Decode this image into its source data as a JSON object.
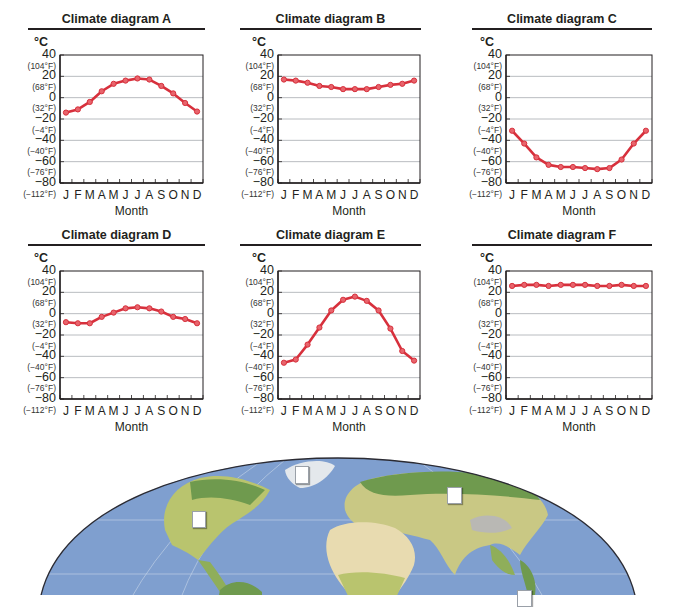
{
  "units": {
    "celsius": "°C"
  },
  "y_ticks": [
    {
      "c": "40",
      "f": "(104°F)"
    },
    {
      "c": "20",
      "f": "(68°F)"
    },
    {
      "c": "0",
      "f": "(32°F)"
    },
    {
      "c": "−20",
      "f": "(−4°F)"
    },
    {
      "c": "−40",
      "f": "(−40°F)"
    },
    {
      "c": "−60",
      "f": "(−76°F)"
    },
    {
      "c": "−80",
      "f": "(−112°F)"
    }
  ],
  "months": [
    "J",
    "F",
    "M",
    "A",
    "M",
    "J",
    "J",
    "A",
    "S",
    "O",
    "N",
    "D"
  ],
  "xlabel": "Month",
  "colors": {
    "line": "#d7303c",
    "marker_fill": "#e8646c",
    "grid": "#b9bcc0",
    "axis": "#231f20"
  },
  "chart_data": [
    {
      "type": "line",
      "title": "Climate diagram A",
      "xlabel": "Month",
      "ylabel": "°C",
      "categories": [
        "J",
        "F",
        "M",
        "A",
        "M",
        "J",
        "J",
        "A",
        "S",
        "O",
        "N",
        "D"
      ],
      "values": [
        -14,
        -11,
        -4,
        6,
        13,
        16,
        18,
        17,
        11,
        4,
        -5,
        -13
      ],
      "ylim": [
        -80,
        40
      ],
      "grid": true
    },
    {
      "type": "line",
      "title": "Climate diagram B",
      "xlabel": "Month",
      "ylabel": "°C",
      "categories": [
        "J",
        "F",
        "M",
        "A",
        "M",
        "J",
        "J",
        "A",
        "S",
        "O",
        "N",
        "D"
      ],
      "values": [
        17,
        16,
        14,
        11,
        10,
        8,
        8,
        8,
        10,
        12,
        13,
        16
      ],
      "ylim": [
        -80,
        40
      ],
      "grid": true
    },
    {
      "type": "line",
      "title": "Climate diagram C",
      "xlabel": "Month",
      "ylabel": "°C",
      "categories": [
        "J",
        "F",
        "M",
        "A",
        "M",
        "J",
        "J",
        "A",
        "S",
        "O",
        "N",
        "D"
      ],
      "values": [
        -31,
        -43,
        -56,
        -63,
        -65,
        -65,
        -66,
        -67,
        -66,
        -58,
        -43,
        -31
      ],
      "ylim": [
        -80,
        40
      ],
      "grid": true
    },
    {
      "type": "line",
      "title": "Climate diagram D",
      "xlabel": "Month",
      "ylabel": "°C",
      "categories": [
        "J",
        "F",
        "M",
        "A",
        "M",
        "J",
        "J",
        "A",
        "S",
        "O",
        "N",
        "D"
      ],
      "values": [
        -8,
        -9,
        -9,
        -3,
        1,
        5,
        6,
        5,
        2,
        -3,
        -5,
        -9
      ],
      "ylim": [
        -80,
        40
      ],
      "grid": true
    },
    {
      "type": "line",
      "title": "Climate diagram E",
      "xlabel": "Month",
      "ylabel": "°C",
      "categories": [
        "J",
        "F",
        "M",
        "A",
        "M",
        "J",
        "J",
        "A",
        "S",
        "O",
        "N",
        "D"
      ],
      "values": [
        -46,
        -43,
        -29,
        -13,
        3,
        13,
        16,
        12,
        3,
        -14,
        -35,
        -44
      ],
      "ylim": [
        -80,
        40
      ],
      "grid": true
    },
    {
      "type": "line",
      "title": "Climate diagram F",
      "xlabel": "Month",
      "ylabel": "°C",
      "categories": [
        "J",
        "F",
        "M",
        "A",
        "M",
        "J",
        "J",
        "A",
        "S",
        "O",
        "N",
        "D"
      ],
      "values": [
        26,
        27,
        27,
        26,
        27,
        27,
        27,
        26,
        26,
        27,
        26,
        26
      ],
      "ylim": [
        -80,
        40
      ],
      "grid": true
    }
  ],
  "map": {
    "label_boxes": 4
  }
}
